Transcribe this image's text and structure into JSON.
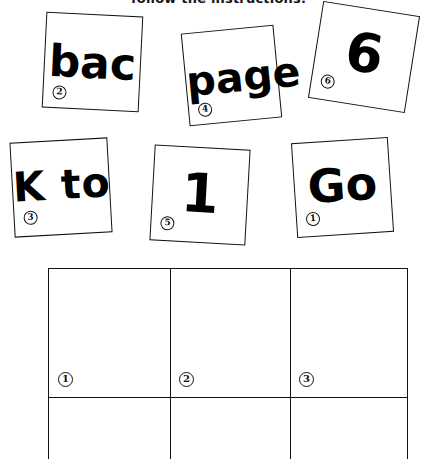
{
  "worksheet": {
    "instruction": "follow the instructions."
  },
  "word_cards": [
    {
      "id": "bac",
      "text": "bac",
      "badge": "2"
    },
    {
      "id": "page",
      "text": "page",
      "badge": "4"
    },
    {
      "id": "six",
      "text": "6",
      "badge": "6"
    },
    {
      "id": "kto",
      "text": "K to",
      "badge": "3"
    },
    {
      "id": "one",
      "text": "1",
      "badge": "5"
    },
    {
      "id": "go",
      "text": "Go",
      "badge": "1"
    }
  ],
  "answer_grid": {
    "columns": 3,
    "cell_badges": [
      "1",
      "2",
      "3"
    ],
    "cells": [
      "",
      "",
      "",
      "",
      "",
      ""
    ]
  },
  "colors": {
    "ink": "#111111",
    "paper": "#ffffff"
  }
}
